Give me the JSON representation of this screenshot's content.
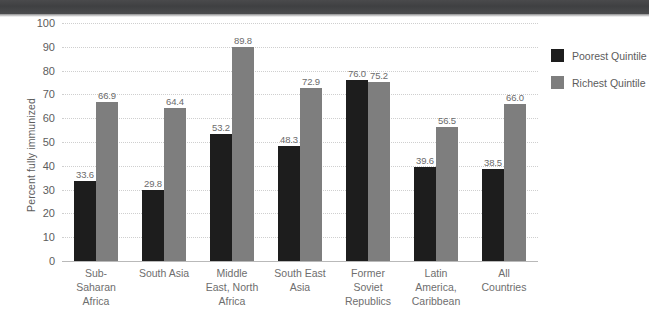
{
  "chart_data": {
    "type": "bar",
    "title": "",
    "xlabel": "",
    "ylabel": "Percent fully immunized",
    "ylim": [
      0,
      100
    ],
    "yticks": [
      "100",
      "90",
      "80",
      "70",
      "60",
      "50",
      "40",
      "30",
      "20",
      "10",
      "0"
    ],
    "grid": true,
    "legend_position": "right",
    "categories": [
      "Sub-\nSaharan\nAfrica",
      "South Asia",
      "Middle\nEast, North\nAfrica",
      "South East\nAsia",
      "Former\nSoviet\nRepublics",
      "Latin\nAmerica,\nCaribbean",
      "All\nCountries"
    ],
    "series": [
      {
        "name": "Poorest Quintile",
        "color": "#1d1d1d",
        "values": [
          33.6,
          29.8,
          53.2,
          48.3,
          76.0,
          39.6,
          38.5
        ],
        "labels": [
          "33.6",
          "29.8",
          "53.2",
          "48.3",
          "76.0",
          "39.6",
          "38.5"
        ]
      },
      {
        "name": "Richest Quintile",
        "color": "#7e7e7e",
        "values": [
          66.9,
          64.4,
          89.8,
          72.9,
          75.2,
          56.5,
          66.0
        ],
        "labels": [
          "66.9",
          "64.4",
          "89.8",
          "72.9",
          "75.2",
          "56.5",
          "66.0"
        ]
      }
    ]
  },
  "legend": {
    "items": [
      {
        "label": "Poorest Quintile",
        "color": "#1d1d1d"
      },
      {
        "label": "Richest Quintile",
        "color": "#7e7e7e"
      }
    ]
  }
}
